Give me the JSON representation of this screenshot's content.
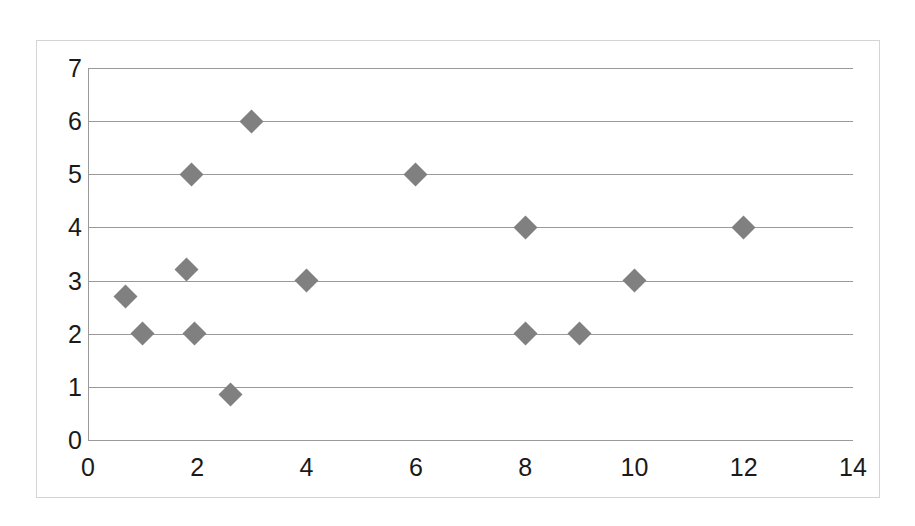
{
  "chart_data": {
    "type": "scatter",
    "title": "",
    "subtitle": "",
    "xlabel": "",
    "ylabel": "",
    "xlim": [
      0,
      14
    ],
    "ylim": [
      0,
      7
    ],
    "xticks": [
      0,
      2,
      4,
      6,
      8,
      10,
      12,
      14
    ],
    "yticks": [
      0,
      1,
      2,
      3,
      4,
      5,
      6,
      7
    ],
    "xtick_labels": [
      "0",
      "2",
      "4",
      "6",
      "8",
      "10",
      "12",
      "14"
    ],
    "ytick_labels": [
      "0",
      "1",
      "2",
      "3",
      "4",
      "5",
      "6",
      "7"
    ],
    "grid": {
      "horizontal": true,
      "vertical": false,
      "color": "#9a9a9a"
    },
    "legend": {
      "visible": false,
      "position": "none",
      "entries": []
    },
    "annotations": [],
    "series": [
      {
        "name": "Series1",
        "marker": "diamond",
        "color": "#808080",
        "points": [
          {
            "x": 0.68,
            "y": 2.7
          },
          {
            "x": 1.0,
            "y": 2.0
          },
          {
            "x": 1.8,
            "y": 3.2
          },
          {
            "x": 1.9,
            "y": 5.0
          },
          {
            "x": 1.95,
            "y": 2.0
          },
          {
            "x": 2.6,
            "y": 0.85
          },
          {
            "x": 3.0,
            "y": 6.0
          },
          {
            "x": 4.0,
            "y": 3.0
          },
          {
            "x": 6.0,
            "y": 5.0
          },
          {
            "x": 8.0,
            "y": 4.0
          },
          {
            "x": 8.0,
            "y": 2.0
          },
          {
            "x": 9.0,
            "y": 2.0
          },
          {
            "x": 10.0,
            "y": 3.0
          },
          {
            "x": 12.0,
            "y": 4.0
          }
        ]
      }
    ]
  },
  "colors": {
    "marker": "#808080",
    "gridline": "#9a9a9a",
    "frame_border": "#d4d4d4",
    "tick_text": "#1a1a1a",
    "background": "#ffffff"
  }
}
